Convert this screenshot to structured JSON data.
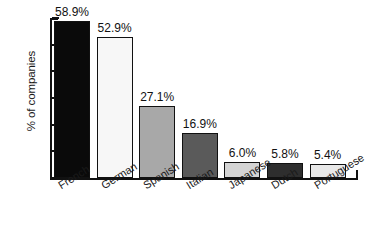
{
  "chart_data": {
    "type": "bar",
    "title": "",
    "xlabel": "",
    "ylabel": "% of companies",
    "ylim": [
      0,
      60
    ],
    "grid": false,
    "legend": "none",
    "categories": [
      "French",
      "German",
      "Spanish",
      "Italian",
      "Japanese",
      "Dutch",
      "Portuguese"
    ],
    "values": [
      58.9,
      52.9,
      27.1,
      16.9,
      6.0,
      5.8,
      5.4
    ],
    "value_labels": [
      "58.9%",
      "52.9%",
      "27.1%",
      "16.9%",
      "6.0%",
      "5.8%",
      "5.4%"
    ],
    "bar_colors": [
      "#0a0a0a",
      "#f7f7f7",
      "#a8a8a8",
      "#5a5a5a",
      "#d4d4d4",
      "#2e2e2e",
      "#e8e8e8"
    ],
    "bar_edge_color": "#111111",
    "y_ticks": [
      0,
      10,
      20,
      30,
      40,
      50,
      60
    ],
    "y_tick_labels": [
      "0%",
      "10%",
      "20%",
      "30%",
      "40%",
      "50%",
      "60%"
    ]
  },
  "axes": {
    "y_title": "% of companies"
  }
}
